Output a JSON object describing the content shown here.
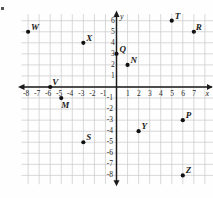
{
  "figure": {
    "kind": "coordinate-plane",
    "axis_names": {
      "x": "x",
      "y": "y"
    },
    "x_tick_labels": [
      "-8",
      "-7",
      "-6",
      "-5",
      "-4",
      "-3",
      "-2",
      "-1",
      "1",
      "2",
      "3",
      "4",
      "5",
      "6",
      "7"
    ],
    "y_tick_labels": [
      "6",
      "5",
      "4",
      "3",
      "2",
      "1",
      "-1",
      "-2",
      "-3",
      "-4",
      "-5",
      "-6",
      "-7",
      "-8"
    ],
    "colors": {
      "grid": "#c9c9c9",
      "axis": "#1a1a1a",
      "point": "#111111",
      "background": "#fefefe"
    }
  },
  "chart_data": {
    "type": "scatter",
    "title": "",
    "xlabel": "x",
    "ylabel": "y",
    "xlim": [
      -8.6,
      7.9
    ],
    "ylim": [
      -8.6,
      6.6
    ],
    "grid": true,
    "legend": "none",
    "xticks": [
      -8,
      -7,
      -6,
      -5,
      -4,
      -3,
      -2,
      -1,
      1,
      2,
      3,
      4,
      5,
      6,
      7
    ],
    "yticks": [
      6,
      5,
      4,
      3,
      2,
      1,
      -1,
      -2,
      -3,
      -4,
      -5,
      -6,
      -7,
      -8
    ],
    "points": [
      {
        "label": "W",
        "x": -8,
        "y": 5,
        "label_dx": 3,
        "label_dy": -9
      },
      {
        "label": "X",
        "x": -3,
        "y": 4,
        "label_dx": 3,
        "label_dy": -9
      },
      {
        "label": "T",
        "x": 5,
        "y": 6,
        "label_dx": 3,
        "label_dy": -9
      },
      {
        "label": "R",
        "x": 7,
        "y": 5,
        "label_dx": 2,
        "label_dy": -9
      },
      {
        "label": "Q",
        "x": 0,
        "y": 3,
        "label_dx": 3,
        "label_dy": -9
      },
      {
        "label": "N",
        "x": 1,
        "y": 2,
        "label_dx": 3,
        "label_dy": -9
      },
      {
        "label": "V",
        "x": -6,
        "y": 0,
        "label_dx": 2,
        "label_dy": -9
      },
      {
        "label": "M",
        "x": -5,
        "y": -1,
        "label_dx": 0,
        "label_dy": 3
      },
      {
        "label": "S",
        "x": -3,
        "y": -5,
        "label_dx": 3,
        "label_dy": -9
      },
      {
        "label": "Y",
        "x": 2,
        "y": -4,
        "label_dx": 3,
        "label_dy": -9
      },
      {
        "label": "P",
        "x": 6,
        "y": -3,
        "label_dx": 3,
        "label_dy": -9
      },
      {
        "label": "Z",
        "x": 6,
        "y": -8,
        "label_dx": 3,
        "label_dy": -9
      }
    ]
  }
}
